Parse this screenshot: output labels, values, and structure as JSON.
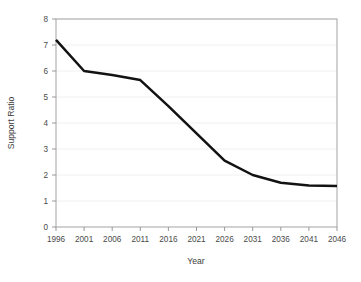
{
  "chart_data": {
    "type": "line",
    "title": "",
    "xlabel": "Year",
    "ylabel": "Support Ratio",
    "x": [
      1996,
      2001,
      2006,
      2011,
      2016,
      2021,
      2026,
      2031,
      2036,
      2041,
      2046
    ],
    "values": [
      7.2,
      6.0,
      5.85,
      5.65,
      4.65,
      3.6,
      2.55,
      2.0,
      1.7,
      1.6,
      1.58
    ],
    "series": [
      {
        "name": "Support Ratio",
        "values": [
          7.2,
          6.0,
          5.85,
          5.65,
          4.65,
          3.6,
          2.55,
          2.0,
          1.7,
          1.6,
          1.58
        ]
      }
    ],
    "xlim": [
      1996,
      2046
    ],
    "ylim": [
      0,
      8
    ],
    "xticks": [
      1996,
      2001,
      2006,
      2011,
      2016,
      2021,
      2026,
      2031,
      2036,
      2041,
      2046
    ],
    "xtick_labels": [
      "1996",
      "2001",
      "2006",
      "2011",
      "2016",
      "2021",
      "2026",
      "2031",
      "2036",
      "2041",
      "2046"
    ],
    "yticks": [
      0,
      1,
      2,
      3,
      4,
      5,
      6,
      7,
      8
    ],
    "ytick_labels": [
      "0",
      "1",
      "2",
      "3",
      "4",
      "5",
      "6",
      "7",
      "8"
    ],
    "grid": true,
    "grid_axis": "y",
    "legend": false,
    "line_color": "#121212",
    "grid_color": "#ececec",
    "frame_color": "#9a9a9a",
    "background": "#ffffff"
  },
  "axes": {
    "y_title": "Support Ratio",
    "x_title": "Year"
  }
}
